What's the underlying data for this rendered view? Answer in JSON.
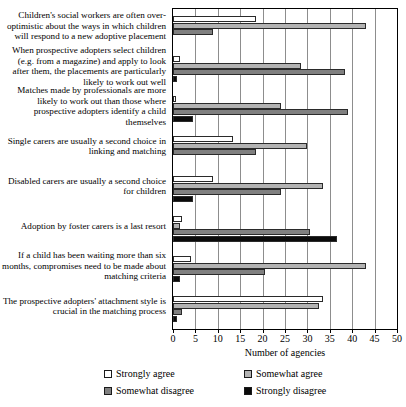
{
  "chart_data": {
    "type": "bar",
    "orientation": "horizontal",
    "title": "",
    "xlabel": "Number of agencies",
    "ylabel": "",
    "xlim": [
      0,
      50
    ],
    "xticks": [
      0,
      5,
      10,
      15,
      20,
      25,
      30,
      35,
      40,
      45,
      50
    ],
    "grid": true,
    "legend_position": "bottom",
    "categories": [
      "Children's social workers are often over-optimistic about the ways in which children will respond to a new adoptive placement",
      "When prospective adopters select children (e.g. from a magazine) and apply to look after them, the placements are particularly likely to work out well",
      "Matches made by professionals are more likely to work out than those where prospective adopters identify a child themselves",
      "Single carers are usually a second choice in linking and matching",
      "Disabled carers are usually a second choice for children",
      "Adoption by foster carers is a last resort",
      "If a child has been waiting more than six months, compromises need to be made about matching criteria",
      "The prospective adopters' attachment style is crucial in the matching process"
    ],
    "series": [
      {
        "name": "Strongly agree",
        "color": "#ffffff",
        "values": [
          18.5,
          1.5,
          0.5,
          13.5,
          9,
          2,
          4,
          33.5
        ]
      },
      {
        "name": "Somewhat agree",
        "color": "#b3b3b3",
        "values": [
          43,
          28.5,
          24,
          30,
          33.5,
          1.5,
          43,
          32.5
        ]
      },
      {
        "name": "Somewhat disagree",
        "color": "#808080",
        "values": [
          9,
          38.5,
          39,
          18.5,
          24,
          30.5,
          20.5,
          2
        ]
      },
      {
        "name": "Strongly disagree",
        "color": "#0a0a0a",
        "values": [
          0,
          1,
          4.5,
          0,
          4.5,
          36.5,
          1.5,
          1
        ]
      }
    ]
  },
  "legend": {
    "entries": [
      {
        "label": "Strongly agree"
      },
      {
        "label": "Somewhat agree"
      },
      {
        "label": "Somewhat disagree"
      },
      {
        "label": "Strongly disagree"
      }
    ]
  }
}
